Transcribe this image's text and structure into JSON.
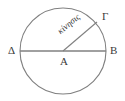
{
  "figure": {
    "type": "geometric-diagram",
    "background_color": "#ffffff",
    "stroke_color": "#808080",
    "text_color": "#3a3a3a",
    "geometry": {
      "circle": {
        "cx": 63,
        "cy": 51,
        "r": 43
      },
      "diameter_line": {
        "x1": 20,
        "y1": 51,
        "x2": 106,
        "y2": 51
      },
      "radius_line": {
        "x1": 63,
        "y1": 51,
        "x2": 97,
        "y2": 22
      }
    },
    "labels": {
      "left_endpoint": "Δ",
      "right_endpoint": "B",
      "center": "A",
      "radius_endpoint": "Γ",
      "radius_annotation": "κίνησις"
    }
  }
}
